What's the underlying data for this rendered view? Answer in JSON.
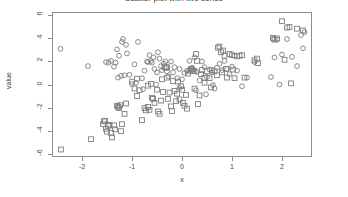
{
  "chart_data": {
    "type": "scatter",
    "title": "Scatter plot with two series",
    "xlabel": "x",
    "ylabel": "value",
    "xlim": [
      -2.6,
      2.6
    ],
    "ylim": [
      -6.3,
      6.3
    ],
    "grid": false,
    "legend": "none",
    "xticks": [
      "-2",
      "-1",
      "0",
      "1",
      "2"
    ],
    "xtick_values": [
      -2,
      -1,
      0,
      1,
      2
    ],
    "yticks": [
      "6",
      "4",
      "2",
      "0",
      "-2",
      "-4",
      "-6"
    ],
    "ytick_values": [
      6,
      4,
      2,
      0,
      -2,
      -4,
      -6
    ],
    "series": [
      {
        "name": "series-circles",
        "marker": "circle",
        "color": "#7d7d7d",
        "points": [
          [
            -2.43,
            3.1
          ],
          [
            -1.88,
            1.6
          ],
          [
            -1.52,
            1.95
          ],
          [
            -1.47,
            1.9
          ],
          [
            -1.42,
            2.05
          ],
          [
            -1.36,
            1.55
          ],
          [
            -1.33,
            1.9
          ],
          [
            -1.3,
            3.05
          ],
          [
            -1.28,
            0.6
          ],
          [
            -1.26,
            2.5
          ],
          [
            -1.22,
            0.75
          ],
          [
            -1.2,
            3.7
          ],
          [
            -1.18,
            3.95
          ],
          [
            -1.15,
            0.8
          ],
          [
            -1.12,
            3.45
          ],
          [
            -1.1,
            2.7
          ],
          [
            -1.05,
            0.85
          ],
          [
            -1.0,
            0.05
          ],
          [
            -0.95,
            1.75
          ],
          [
            -0.92,
            0.15
          ],
          [
            -0.88,
            3.7
          ],
          [
            -0.8,
            0.55
          ],
          [
            -0.75,
            1.2
          ],
          [
            -0.7,
            2.0
          ],
          [
            -0.68,
            1.95
          ],
          [
            -0.65,
            2.55
          ],
          [
            -0.62,
            2.05
          ],
          [
            -0.6,
            1.9
          ],
          [
            -0.57,
            2.35
          ],
          [
            -0.55,
            1.35
          ],
          [
            -0.5,
            1.05
          ],
          [
            -0.48,
            2.8
          ],
          [
            -0.45,
            2.25
          ],
          [
            -0.42,
            1.6
          ],
          [
            -0.4,
            1.25
          ],
          [
            -0.36,
            1.8
          ],
          [
            -0.33,
            2.0
          ],
          [
            -0.3,
            1.15
          ],
          [
            -0.27,
            0.7
          ],
          [
            -0.22,
            2.0
          ],
          [
            -0.18,
            1.05
          ],
          [
            -0.15,
            1.5
          ],
          [
            -0.1,
            0.55
          ],
          [
            -0.05,
            1.35
          ],
          [
            0.0,
            0.45
          ],
          [
            0.05,
            1.0
          ],
          [
            0.1,
            1.2
          ],
          [
            0.15,
            2.05
          ],
          [
            0.2,
            1.45
          ],
          [
            0.25,
            2.35
          ],
          [
            0.3,
            1.1
          ],
          [
            0.35,
            0.35
          ],
          [
            0.4,
            2.0
          ],
          [
            0.45,
            1.5
          ],
          [
            0.5,
            0.65
          ],
          [
            0.55,
            1.3
          ],
          [
            0.6,
            1.05
          ],
          [
            0.65,
            -0.35
          ],
          [
            0.7,
            1.45
          ],
          [
            0.75,
            1.8
          ],
          [
            0.8,
            1.25
          ],
          [
            0.85,
            2.05
          ],
          [
            0.9,
            1.35
          ],
          [
            0.95,
            0.9
          ],
          [
            1.0,
            1.55
          ],
          [
            1.05,
            2.5
          ],
          [
            1.1,
            1.2
          ],
          [
            1.2,
            -0.15
          ],
          [
            1.3,
            0.6
          ],
          [
            1.45,
            1.95
          ],
          [
            1.78,
            0.65
          ],
          [
            1.82,
            3.95
          ],
          [
            1.85,
            2.35
          ],
          [
            1.9,
            3.9
          ],
          [
            1.95,
            0.0
          ],
          [
            2.0,
            2.6
          ],
          [
            2.1,
            3.95
          ],
          [
            2.2,
            2.4
          ],
          [
            2.3,
            1.6
          ],
          [
            2.38,
            4.3
          ],
          [
            2.42,
            3.15
          ],
          [
            2.45,
            4.55
          ],
          [
            -0.52,
            0.0
          ],
          [
            0.28,
            -0.5
          ],
          [
            0.62,
            -0.05
          ],
          [
            -0.05,
            -0.3
          ],
          [
            0.48,
            -0.85
          ],
          [
            -0.78,
            -0.4
          ]
        ]
      },
      {
        "name": "series-squares",
        "marker": "square",
        "color": "#7d7d7d",
        "points": [
          [
            -2.42,
            -5.65
          ],
          [
            -1.82,
            -4.75
          ],
          [
            -1.58,
            -3.45
          ],
          [
            -1.56,
            -3.2
          ],
          [
            -1.54,
            -3.15
          ],
          [
            -1.52,
            -3.85
          ],
          [
            -1.5,
            -4.1
          ],
          [
            -1.48,
            -3.6
          ],
          [
            -1.45,
            -3.5
          ],
          [
            -1.42,
            -4.2
          ],
          [
            -1.4,
            -4.6
          ],
          [
            -1.36,
            -3.55
          ],
          [
            -1.34,
            -3.9
          ],
          [
            -1.3,
            -1.85
          ],
          [
            -1.28,
            -1.95
          ],
          [
            -1.26,
            -2.05
          ],
          [
            -1.24,
            -1.8
          ],
          [
            -1.22,
            -4.05
          ],
          [
            -1.2,
            -3.45
          ],
          [
            -1.15,
            -2.55
          ],
          [
            -1.12,
            -1.65
          ],
          [
            -1.0,
            0.25
          ],
          [
            -0.95,
            -0.35
          ],
          [
            -0.9,
            -1.0
          ],
          [
            -0.85,
            -0.5
          ],
          [
            -0.8,
            -3.1
          ],
          [
            -0.75,
            -2.05
          ],
          [
            -0.72,
            -2.25
          ],
          [
            -0.68,
            -1.95
          ],
          [
            -0.65,
            -2.2
          ],
          [
            -0.6,
            -1.15
          ],
          [
            -0.58,
            -1.25
          ],
          [
            -0.55,
            -1.6
          ],
          [
            -0.5,
            -0.45
          ],
          [
            -0.48,
            -2.35
          ],
          [
            -0.45,
            -2.55
          ],
          [
            -0.42,
            -1.4
          ],
          [
            -0.4,
            0.45
          ],
          [
            -0.38,
            -0.65
          ],
          [
            -0.35,
            1.5
          ],
          [
            -0.32,
            1.45
          ],
          [
            -0.3,
            0.6
          ],
          [
            -0.28,
            -1.25
          ],
          [
            -0.25,
            -0.7
          ],
          [
            -0.22,
            -1.9
          ],
          [
            -0.2,
            -2.3
          ],
          [
            -0.18,
            0.3
          ],
          [
            -0.15,
            -0.55
          ],
          [
            -0.12,
            -1.45
          ],
          [
            -0.1,
            -0.8
          ],
          [
            -0.08,
            0.25
          ],
          [
            -0.05,
            -1.3
          ],
          [
            -0.02,
            -0.15
          ],
          [
            0.0,
            -0.45
          ],
          [
            0.02,
            -1.6
          ],
          [
            0.05,
            -1.85
          ],
          [
            0.08,
            -0.9
          ],
          [
            0.1,
            -2.1
          ],
          [
            0.12,
            0.95
          ],
          [
            0.15,
            1.2
          ],
          [
            0.18,
            1.35
          ],
          [
            0.2,
            1.3
          ],
          [
            0.22,
            1.2
          ],
          [
            0.25,
            -0.35
          ],
          [
            0.28,
            2.65
          ],
          [
            0.3,
            2.05
          ],
          [
            0.32,
            -1.7
          ],
          [
            0.35,
            -0.95
          ],
          [
            0.38,
            0.9
          ],
          [
            0.4,
            1.25
          ],
          [
            0.45,
            0.15
          ],
          [
            0.5,
            1.15
          ],
          [
            0.55,
            0.55
          ],
          [
            0.6,
            1.25
          ],
          [
            0.65,
            1.15
          ],
          [
            0.7,
            0.8
          ],
          [
            0.72,
            3.2
          ],
          [
            0.75,
            3.3
          ],
          [
            0.78,
            2.8
          ],
          [
            0.8,
            1.05
          ],
          [
            0.82,
            2.95
          ],
          [
            0.85,
            2.5
          ],
          [
            0.88,
            1.35
          ],
          [
            0.9,
            0.6
          ],
          [
            0.95,
            2.65
          ],
          [
            1.0,
            2.55
          ],
          [
            1.02,
            1.3
          ],
          [
            1.05,
            0.55
          ],
          [
            1.1,
            2.45
          ],
          [
            1.15,
            2.5
          ],
          [
            1.2,
            2.55
          ],
          [
            1.25,
            0.6
          ],
          [
            1.45,
            2.1
          ],
          [
            1.5,
            2.25
          ],
          [
            1.52,
            1.85
          ],
          [
            1.82,
            4.05
          ],
          [
            1.85,
            3.9
          ],
          [
            1.9,
            4.0
          ],
          [
            2.0,
            5.5
          ],
          [
            2.05,
            2.15
          ],
          [
            2.1,
            4.95
          ],
          [
            2.15,
            5.0
          ],
          [
            2.18,
            0.1
          ],
          [
            2.3,
            4.85
          ],
          [
            2.42,
            4.7
          ],
          [
            -0.62,
            0.05
          ],
          [
            -0.3,
            1.5
          ],
          [
            0.45,
            0.6
          ],
          [
            0.58,
            -0.25
          ],
          [
            -0.68,
            -0.1
          ],
          [
            -0.9,
            0.5
          ],
          [
            0.25,
            1.15
          ]
        ]
      }
    ]
  },
  "axes": {
    "y_title": "value",
    "x_title": "x"
  }
}
